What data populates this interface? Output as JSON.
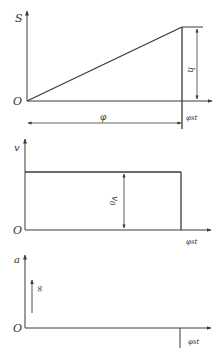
{
  "colors": {
    "line": "#3a3a3a",
    "text": "#333333",
    "background": "#ffffff"
  },
  "displacement_plot": {
    "y_axis_label": "S",
    "origin_label": "O",
    "rise_label": "h",
    "travel_label": "φ",
    "x_end_label": "φst"
  },
  "velocity_plot": {
    "y_axis_label": "v",
    "origin_label": "O",
    "level_label": "v0",
    "level_label_base": "v",
    "level_label_sub": "0",
    "x_end_label": "φst"
  },
  "acceleration_plot": {
    "y_axis_label": "a",
    "origin_label": "O",
    "impulse_label": "∞",
    "x_end_label": "φst"
  }
}
